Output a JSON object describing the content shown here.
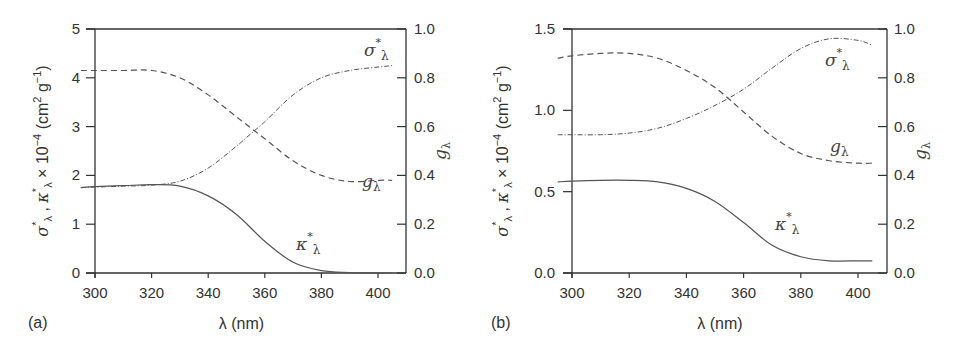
{
  "chart_data": [
    {
      "panel": "(a)",
      "type": "line",
      "xlabel": "λ (nm)",
      "ylabel": "σ*λ , κ*λ × 10⁻⁴ (cm² g⁻¹)",
      "ylabel_right": "gλ",
      "xlim": [
        295,
        410
      ],
      "ylim": [
        0,
        5
      ],
      "ylim_right": [
        0,
        1.0
      ],
      "x_ticks": [
        300,
        320,
        340,
        360,
        380,
        400
      ],
      "y_ticks": [
        "0",
        "1",
        "2",
        "3",
        "4",
        "5"
      ],
      "y_ticks_right": [
        "0.0",
        "0.2",
        "0.4",
        "0.6",
        "0.8",
        "1.0"
      ],
      "grid": false,
      "series": [
        {
          "name": "σ*λ",
          "style": "dash-dot",
          "axis": "left",
          "x": [
            295,
            300,
            310,
            320,
            330,
            340,
            350,
            355,
            360,
            370,
            380,
            390,
            400,
            405
          ],
          "y": [
            1.75,
            1.76,
            1.78,
            1.8,
            1.88,
            2.15,
            2.6,
            2.85,
            3.1,
            3.65,
            4.0,
            4.15,
            4.22,
            4.25
          ]
        },
        {
          "name": "κ*λ",
          "style": "solid",
          "axis": "left",
          "x": [
            295,
            300,
            310,
            320,
            330,
            340,
            350,
            360,
            370,
            380,
            390,
            400,
            405
          ],
          "y": [
            1.75,
            1.77,
            1.79,
            1.81,
            1.78,
            1.58,
            1.2,
            0.65,
            0.22,
            0.05,
            0.01,
            0.0,
            0.0
          ]
        },
        {
          "name": "gλ",
          "style": "dashed",
          "axis": "right",
          "x": [
            295,
            300,
            310,
            320,
            330,
            340,
            350,
            360,
            370,
            380,
            390,
            400,
            405
          ],
          "y": [
            0.83,
            0.83,
            0.83,
            0.83,
            0.8,
            0.73,
            0.64,
            0.55,
            0.46,
            0.4,
            0.375,
            0.38,
            0.38
          ]
        }
      ],
      "annotations": [
        "σ*λ",
        "gλ",
        "κ*λ"
      ]
    },
    {
      "panel": "(b)",
      "type": "line",
      "xlabel": "λ (nm)",
      "ylabel": "σ*λ , κ*λ × 10⁻⁴ (cm² g⁻¹)",
      "ylabel_right": "gλ",
      "xlim": [
        295,
        410
      ],
      "ylim": [
        0,
        1.5
      ],
      "ylim_right": [
        0,
        1.0
      ],
      "x_ticks": [
        300,
        320,
        340,
        360,
        380,
        400
      ],
      "y_ticks": [
        "0.0",
        "0.5",
        "1.0",
        "1.5"
      ],
      "y_ticks_right": [
        "0.0",
        "0.2",
        "0.4",
        "0.6",
        "0.8",
        "1.0"
      ],
      "grid": false,
      "series": [
        {
          "name": "σ*λ",
          "style": "dash-dot",
          "axis": "left",
          "x": [
            295,
            300,
            310,
            320,
            330,
            340,
            350,
            360,
            370,
            380,
            390,
            400,
            405
          ],
          "y": [
            0.85,
            0.85,
            0.85,
            0.86,
            0.89,
            0.95,
            1.03,
            1.13,
            1.26,
            1.38,
            1.44,
            1.43,
            1.4
          ]
        },
        {
          "name": "κ*λ",
          "style": "solid",
          "axis": "left",
          "x": [
            295,
            300,
            310,
            320,
            330,
            340,
            350,
            360,
            370,
            380,
            390,
            400,
            405
          ],
          "y": [
            0.56,
            0.565,
            0.57,
            0.57,
            0.56,
            0.52,
            0.44,
            0.31,
            0.17,
            0.1,
            0.075,
            0.075,
            0.075
          ]
        },
        {
          "name": "gλ",
          "style": "dashed",
          "axis": "right",
          "x": [
            295,
            300,
            310,
            320,
            330,
            340,
            350,
            360,
            370,
            380,
            390,
            400,
            405
          ],
          "y": [
            0.88,
            0.89,
            0.9,
            0.9,
            0.88,
            0.83,
            0.76,
            0.66,
            0.56,
            0.49,
            0.46,
            0.45,
            0.45
          ]
        }
      ],
      "annotations": [
        "σ*λ",
        "gλ",
        "κ*λ"
      ]
    }
  ],
  "labels": {
    "panel_a": "(a)",
    "panel_b": "(b)",
    "xlabel": "λ (nm)",
    "ylabel_left_sigma": "σ",
    "ylabel_left_kappa": "κ",
    "ylabel_left_rest": "× 10",
    "ylabel_exp": "−4",
    "ylabel_units": "(cm",
    "ylabel_units2": " g",
    "ylabel_right": "g",
    "lambda_sub": "λ",
    "sigma_curve": "σ",
    "kappa_curve": "κ",
    "g_curve": "g",
    "star": "*"
  },
  "colors": {
    "axis": "#333333",
    "curve": "#555555"
  }
}
